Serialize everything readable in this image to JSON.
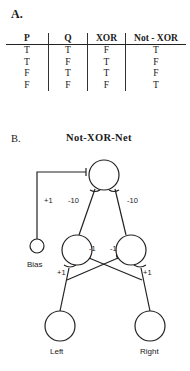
{
  "section_a": {
    "label": "A.",
    "table": {
      "headers": [
        "P",
        "Q",
        "XOR",
        "Not - XOR"
      ],
      "rows": [
        [
          "T",
          "T",
          "F",
          "T"
        ],
        [
          "T",
          "F",
          "T",
          "F"
        ],
        [
          "F",
          "T",
          "T",
          "F"
        ],
        [
          "F",
          "F",
          "F",
          "T"
        ]
      ]
    }
  },
  "section_b": {
    "label": "B.",
    "title": "Not-XOR-Net",
    "nodes": {
      "bias": "Bias",
      "left": "Left",
      "right": "Right"
    },
    "weights": {
      "bias_to_output": "+1",
      "hidden_left_to_output": "-10",
      "hidden_right_to_output": "-10",
      "right_to_hidden_left": "-1",
      "left_to_hidden_right": "-1",
      "left_to_hidden_left": "+1",
      "right_to_hidden_right": "+1"
    }
  }
}
